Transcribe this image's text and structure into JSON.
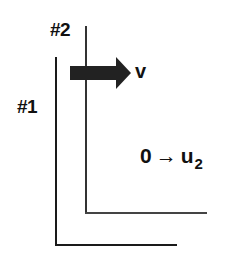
{
  "diagram": {
    "plates": [
      {
        "id": "plate-1",
        "label": "#1"
      },
      {
        "id": "plate-2",
        "label": "#2"
      }
    ],
    "velocity_arrow": {
      "label": "v",
      "direction": "right",
      "color": "#222222"
    },
    "transition": {
      "from": "0",
      "arrow": "→",
      "to_base": "u",
      "to_subscript": "2"
    }
  }
}
